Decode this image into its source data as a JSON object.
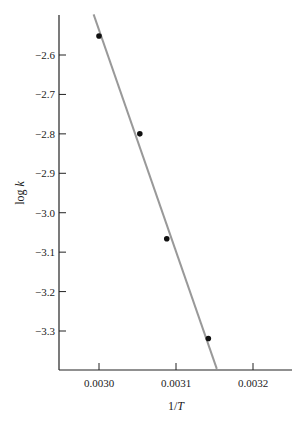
{
  "chart_data": {
    "type": "scatter",
    "title": "",
    "xlabel": "1/T",
    "ylabel": "log k",
    "xlim": [
      0.00295,
      0.003255
    ],
    "ylim": [
      -3.4,
      -2.5
    ],
    "grid": false,
    "legend": null,
    "x_ticks": [
      "0.0030",
      "0.0031",
      "0.0032"
    ],
    "y_ticks": [
      "-2.6",
      "-2.7",
      "-2.8",
      "-2.9",
      "-3.0",
      "-3.1",
      "-3.2",
      "-3.3"
    ],
    "series": [
      {
        "name": "data points",
        "x": [
          0.003,
          0.003053,
          0.003088,
          0.003142
        ],
        "y": [
          -2.552,
          -2.8,
          -3.066,
          -3.319
        ]
      }
    ],
    "fit_line": {
      "name": "linear fit",
      "color": "#999999",
      "x": [
        0.002993,
        0.003153
      ],
      "y": [
        -2.497,
        -3.396
      ]
    }
  },
  "axes": {
    "xlabel_main": "1/",
    "xlabel_var": "T",
    "ylabel_main": "log ",
    "ylabel_var": "k"
  }
}
